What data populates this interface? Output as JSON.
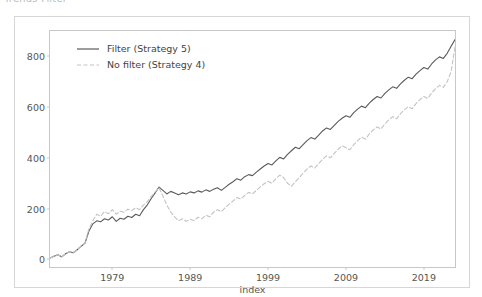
{
  "caption": "Trends Filter",
  "chart_data": {
    "type": "line",
    "title": "",
    "xlabel": "index",
    "ylabel": "",
    "xlim": [
      1971.0,
      2023.0
    ],
    "ylim": [
      -30,
      900
    ],
    "grid": false,
    "legend_position": "upper left",
    "xticks": [
      1979,
      1989,
      1999,
      2009,
      2019
    ],
    "xtick_labels": [
      "1979",
      "1989",
      "1999",
      "2009",
      "2019"
    ],
    "yticks": [
      0,
      200,
      400,
      600,
      800
    ],
    "ytick_labels": [
      "0",
      "200",
      "400",
      "600",
      "800"
    ],
    "series": [
      {
        "name": "Filter (Strategy 5)",
        "label": "Filter (Strategy 5)",
        "color": "#5a5a5a",
        "linestyle": "solid",
        "x": [
          1971.0,
          1971.5,
          1972.0,
          1972.5,
          1973.0,
          1973.5,
          1974.0,
          1974.5,
          1975.0,
          1975.5,
          1976.0,
          1976.5,
          1977.0,
          1977.5,
          1978.0,
          1978.5,
          1979.0,
          1979.5,
          1980.0,
          1980.5,
          1981.0,
          1981.5,
          1982.0,
          1982.5,
          1983.0,
          1983.5,
          1984.0,
          1984.5,
          1985.0,
          1985.5,
          1986.0,
          1986.5,
          1987.0,
          1987.5,
          1988.0,
          1988.5,
          1989.0,
          1989.5,
          1990.0,
          1990.5,
          1991.0,
          1991.5,
          1992.0,
          1992.5,
          1993.0,
          1993.5,
          1994.0,
          1994.5,
          1995.0,
          1995.5,
          1996.0,
          1996.5,
          1997.0,
          1997.5,
          1998.0,
          1998.5,
          1999.0,
          1999.5,
          2000.0,
          2000.5,
          2001.0,
          2001.5,
          2002.0,
          2002.5,
          2003.0,
          2003.5,
          2004.0,
          2004.5,
          2005.0,
          2005.5,
          2006.0,
          2006.5,
          2007.0,
          2007.5,
          2008.0,
          2008.5,
          2009.0,
          2009.5,
          2010.0,
          2010.5,
          2011.0,
          2011.5,
          2012.0,
          2012.5,
          2013.0,
          2013.5,
          2014.0,
          2014.5,
          2015.0,
          2015.5,
          2016.0,
          2016.5,
          2017.0,
          2017.5,
          2018.0,
          2018.5,
          2019.0,
          2019.5,
          2020.0,
          2020.5,
          2021.0,
          2021.5,
          2022.0,
          2022.5,
          2023.0
        ],
        "y": [
          5,
          12,
          18,
          10,
          22,
          30,
          26,
          38,
          52,
          64,
          112,
          140,
          152,
          148,
          160,
          155,
          168,
          150,
          162,
          158,
          170,
          165,
          178,
          172,
          196,
          215,
          240,
          262,
          285,
          272,
          258,
          268,
          262,
          255,
          262,
          258,
          266,
          262,
          270,
          265,
          274,
          268,
          276,
          282,
          272,
          284,
          296,
          306,
          318,
          312,
          326,
          334,
          330,
          344,
          356,
          368,
          378,
          372,
          388,
          402,
          396,
          414,
          428,
          442,
          436,
          452,
          468,
          480,
          474,
          490,
          506,
          518,
          512,
          528,
          544,
          556,
          566,
          560,
          578,
          592,
          604,
          598,
          616,
          630,
          642,
          636,
          654,
          668,
          680,
          674,
          692,
          706,
          718,
          712,
          730,
          744,
          756,
          750,
          770,
          786,
          798,
          792,
          812,
          840,
          866
        ]
      },
      {
        "name": "No filter (Strategy 4)",
        "label": "No filter (Strategy 4)",
        "color": "#c3c3c3",
        "linestyle": "dashed",
        "x": [
          1971.0,
          1971.5,
          1972.0,
          1972.5,
          1973.0,
          1973.5,
          1974.0,
          1974.5,
          1975.0,
          1975.5,
          1976.0,
          1976.5,
          1977.0,
          1977.5,
          1978.0,
          1978.5,
          1979.0,
          1979.5,
          1980.0,
          1980.5,
          1981.0,
          1981.5,
          1982.0,
          1982.5,
          1983.0,
          1983.5,
          1984.0,
          1984.5,
          1985.0,
          1985.5,
          1986.0,
          1986.5,
          1987.0,
          1987.5,
          1988.0,
          1988.5,
          1989.0,
          1989.5,
          1990.0,
          1990.5,
          1991.0,
          1991.5,
          1992.0,
          1992.5,
          1993.0,
          1993.5,
          1994.0,
          1994.5,
          1995.0,
          1995.5,
          1996.0,
          1996.5,
          1997.0,
          1997.5,
          1998.0,
          1998.5,
          1999.0,
          1999.5,
          2000.0,
          2000.5,
          2001.0,
          2001.5,
          2002.0,
          2002.5,
          2003.0,
          2003.5,
          2004.0,
          2004.5,
          2005.0,
          2005.5,
          2006.0,
          2006.5,
          2007.0,
          2007.5,
          2008.0,
          2008.5,
          2009.0,
          2009.5,
          2010.0,
          2010.5,
          2011.0,
          2011.5,
          2012.0,
          2012.5,
          2013.0,
          2013.5,
          2014.0,
          2014.5,
          2015.0,
          2015.5,
          2016.0,
          2016.5,
          2017.0,
          2017.5,
          2018.0,
          2018.5,
          2019.0,
          2019.5,
          2020.0,
          2020.5,
          2021.0,
          2021.5,
          2022.0,
          2022.5,
          2023.0
        ],
        "y": [
          5,
          12,
          18,
          10,
          22,
          30,
          26,
          38,
          52,
          66,
          120,
          152,
          178,
          170,
          188,
          180,
          196,
          178,
          190,
          186,
          198,
          192,
          204,
          196,
          214,
          228,
          248,
          266,
          282,
          250,
          214,
          186,
          168,
          152,
          160,
          150,
          158,
          152,
          166,
          160,
          174,
          168,
          186,
          196,
          188,
          204,
          218,
          230,
          244,
          238,
          252,
          264,
          258,
          272,
          286,
          298,
          308,
          300,
          318,
          332,
          322,
          300,
          288,
          306,
          322,
          340,
          356,
          368,
          360,
          378,
          394,
          408,
          400,
          418,
          434,
          448,
          440,
          432,
          452,
          468,
          482,
          474,
          494,
          510,
          522,
          514,
          534,
          550,
          562,
          554,
          574,
          590,
          602,
          594,
          614,
          630,
          642,
          634,
          656,
          672,
          686,
          678,
          700,
          740,
          836
        ]
      }
    ]
  }
}
